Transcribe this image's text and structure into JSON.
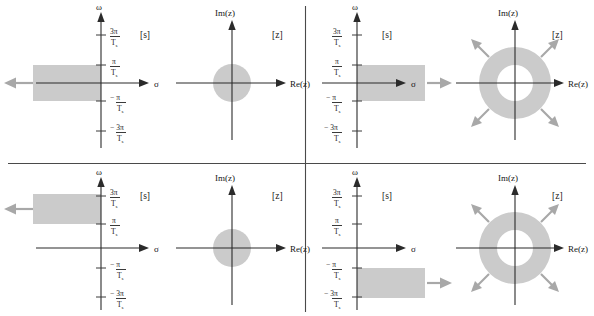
{
  "figure": {
    "colors": {
      "region_fill": "#cbcbcb",
      "axis": "#2b2b2b",
      "gray_arrow": "#a8a8a8",
      "divider": "#4a4a4a",
      "background": "#ffffff"
    },
    "axis_labels": {
      "omega": "ω",
      "sigma": "σ",
      "imz": "Im(z)",
      "rez": "Re(z)"
    },
    "plane_tags": {
      "s": "[s]",
      "z": "[z]"
    },
    "ticks": {
      "pos3": {
        "num": "3π",
        "den": "T",
        "den_sub": "s",
        "sign": ""
      },
      "pos1": {
        "num": "π",
        "den": "T",
        "den_sub": "s",
        "sign": ""
      },
      "neg1": {
        "num": "π",
        "den": "T",
        "den_sub": "s",
        "sign": "−"
      },
      "neg3": {
        "num": "3π",
        "den": "T",
        "den_sub": "s",
        "sign": "−"
      }
    },
    "panels": [
      {
        "id": "top-left",
        "position": "top-left",
        "s_plane": {
          "tag": "[s]",
          "region": "horizontal strip in left half-plane between -π/Ts and +π/Ts, extending to -∞",
          "strip_from": "−π/T_s",
          "strip_to": "π/T_s",
          "direction": "left",
          "arrow_color": "#a8a8a8"
        },
        "z_plane": {
          "tag": "[z]",
          "shape": "disk",
          "description": "filled disk centered at origin (interior of unit circle)",
          "arrows": 0
        }
      },
      {
        "id": "top-right",
        "position": "top-right",
        "s_plane": {
          "tag": "[s]",
          "region": "horizontal strip in right half-plane between -π/Ts and +π/Ts, extending to +∞",
          "strip_from": "−π/T_s",
          "strip_to": "π/T_s",
          "direction": "right",
          "arrow_color": "#a8a8a8"
        },
        "z_plane": {
          "tag": "[z]",
          "shape": "annulus",
          "description": "annulus outside unit circle expanding outward",
          "arrows": 4
        }
      },
      {
        "id": "bottom-left",
        "position": "bottom-left",
        "s_plane": {
          "tag": "[s]",
          "region": "horizontal strip in left half-plane between π/Ts and 3π/Ts, extending to -∞",
          "strip_from": "π/T_s",
          "strip_to": "3π/T_s",
          "direction": "left",
          "arrow_color": "#a8a8a8"
        },
        "z_plane": {
          "tag": "[z]",
          "shape": "disk",
          "description": "filled disk centered at origin (interior of unit circle)",
          "arrows": 0
        }
      },
      {
        "id": "bottom-right",
        "position": "bottom-right",
        "s_plane": {
          "tag": "[s]",
          "region": "horizontal strip in right half-plane between -3π/Ts and -π/Ts, extending to +∞",
          "strip_from": "−3π/T_s",
          "strip_to": "−π/T_s",
          "direction": "right",
          "arrow_color": "#a8a8a8"
        },
        "z_plane": {
          "tag": "[z]",
          "shape": "annulus",
          "description": "annulus outside unit circle expanding outward",
          "arrows": 4
        }
      }
    ]
  }
}
